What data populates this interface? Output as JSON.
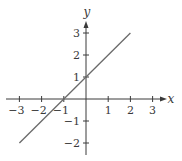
{
  "chart_data": {
    "type": "line",
    "title": "",
    "xlabel": "x",
    "ylabel": "y",
    "xlim": [
      -3.3,
      3.6
    ],
    "ylim": [
      -2.3,
      3.5
    ],
    "x_ticks": [
      -3,
      -2,
      -1,
      1,
      2,
      3
    ],
    "y_ticks": [
      -2,
      -1,
      1,
      2,
      3
    ],
    "x_tick_labels": [
      "−3",
      "−2",
      "−1",
      "1",
      "2",
      "3"
    ],
    "y_tick_labels": [
      "−2",
      "−1",
      "1",
      "2",
      "3"
    ],
    "grid": false,
    "legend": null,
    "series": [
      {
        "name": "y = x + 1",
        "x": [
          -3,
          2
        ],
        "y": [
          -2,
          3
        ],
        "color": "#6a6a6a"
      }
    ]
  },
  "colors": {
    "axis": "#3a3a3a",
    "line": "#6a6a6a",
    "background": "#ffffff"
  }
}
